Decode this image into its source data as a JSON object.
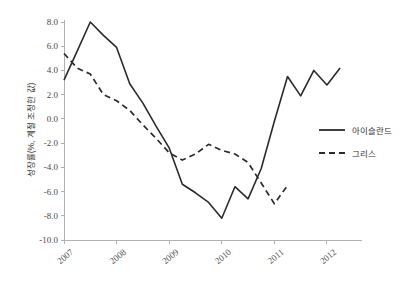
{
  "chart_data": {
    "type": "line",
    "title": "",
    "subtitle": "",
    "xlabel": "",
    "ylabel": "성장률(%, 계절 조정한 값)",
    "ylim": [
      -10.0,
      8.0
    ],
    "yticks": [
      8.0,
      6.0,
      4.0,
      2.0,
      0.0,
      -2.0,
      -4.0,
      -6.0,
      -8.0,
      -10.0
    ],
    "ytick_labels": [
      "8.0",
      "6.0",
      "4.0",
      "2.0",
      "0.0",
      "-2.0",
      "-4.0",
      "-6.0",
      "-8.0",
      "-10.0"
    ],
    "xticks": [
      2007,
      2008,
      2009,
      2010,
      2011,
      2012
    ],
    "xtick_labels": [
      "2007",
      "2008",
      "2009",
      "2010",
      "2011",
      "2012"
    ],
    "xlim": [
      2007.0,
      2012.4
    ],
    "grid": false,
    "legend_position": "right",
    "series": [
      {
        "name": "아이슬란드",
        "style": "solid",
        "color": "#2b2b2b",
        "x": [
          2007.0,
          2007.25,
          2007.5,
          2007.75,
          2008.0,
          2008.25,
          2008.5,
          2008.75,
          2009.0,
          2009.25,
          2009.5,
          2009.75,
          2010.0,
          2010.25,
          2010.5,
          2010.75,
          2011.0,
          2011.25,
          2011.5,
          2011.75,
          2012.0
        ],
        "values": [
          3.2,
          5.6,
          8.0,
          6.9,
          5.9,
          2.9,
          1.3,
          -0.6,
          -2.4,
          -5.4,
          -6.1,
          -6.9,
          -8.2,
          -5.6,
          -6.6,
          -4.1,
          -0.2,
          3.5,
          1.9,
          4.0,
          2.8
        ]
      },
      {
        "name": "그리스",
        "style": "dashed",
        "color": "#2b2b2b",
        "x": [
          2007.0,
          2007.25,
          2007.5,
          2007.75,
          2008.0,
          2008.25,
          2008.5,
          2008.75,
          2009.0,
          2009.25,
          2009.5,
          2009.75,
          2010.0,
          2010.25,
          2010.5,
          2010.75,
          2011.0
        ],
        "values": [
          5.4,
          4.2,
          3.7,
          2.0,
          1.5,
          0.7,
          -0.5,
          -1.6,
          -2.8,
          -3.4,
          -2.9,
          -2.1,
          -2.6,
          -2.9,
          -3.6,
          -5.3,
          -7.0
        ]
      }
    ],
    "series_extra_tail": [
      {
        "name": "아이슬란드",
        "x": [
          2012.0,
          2012.25
        ],
        "values": [
          2.8,
          4.2
        ]
      },
      {
        "name": "그리스",
        "x": [
          2011.0,
          2011.25
        ],
        "values": [
          -7.0,
          -5.5
        ]
      }
    ]
  },
  "legend": {
    "items": [
      {
        "label": "아이슬란드",
        "style": "solid"
      },
      {
        "label": "그리스",
        "style": "dashed"
      }
    ]
  },
  "axes": {
    "y_title": "성장률(%, 계절 조정한 값)"
  }
}
